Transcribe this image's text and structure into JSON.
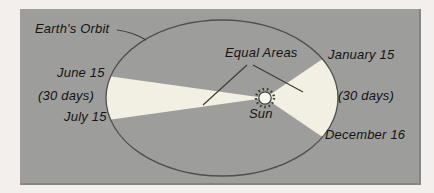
{
  "figure": {
    "orbit_label": "Earth's Orbit",
    "equal_areas_label": "Equal Areas",
    "sun_label": "Sun",
    "left_sector": {
      "start_label": "June 15",
      "duration_label": "(30 days)",
      "end_label": "July 15"
    },
    "right_sector": {
      "start_label": "January 15",
      "duration_label": "(30 days)",
      "end_label": "December 16"
    }
  },
  "colors": {
    "page_bg": "#f3efec",
    "panel_bg": "#9d9d9b",
    "sector_fill": "#f1f0e3",
    "orbit_stroke": "#4f4f4d",
    "sun_fill": "#f7f7ef",
    "sun_stroke": "#3a3a38",
    "text": "#141414"
  }
}
